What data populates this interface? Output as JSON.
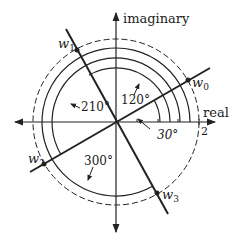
{
  "diagram": {
    "axes": {
      "real_label": "real",
      "imaginary_label": "imaginary",
      "tick_label": "2"
    },
    "roots": [
      {
        "name": "w0",
        "label": "w",
        "sub": "0",
        "angle_deg": 30
      },
      {
        "name": "w1",
        "label": "w",
        "sub": "1",
        "angle_deg": 120
      },
      {
        "name": "w2",
        "label": "w",
        "sub": "2",
        "angle_deg": 210
      },
      {
        "name": "w3",
        "label": "w",
        "sub": "3",
        "angle_deg": 300
      }
    ],
    "angle_labels": {
      "a30": "30°",
      "a120": "120°",
      "a210": "210°",
      "a300": "300°"
    },
    "colors": {
      "ink": "#222222",
      "background": "#ffffff"
    }
  }
}
